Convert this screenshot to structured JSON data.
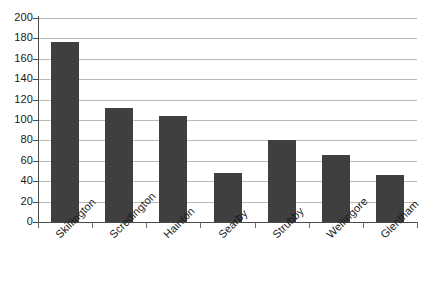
{
  "chart_data": {
    "type": "bar",
    "title": "",
    "subtitle": "",
    "xlabel": "",
    "ylabel": "",
    "categories": [
      "Skillington",
      "Scredington",
      "Hainton",
      "Searby",
      "Strubby",
      "Wellingore",
      "Glentham"
    ],
    "values": [
      176,
      112,
      104,
      48,
      80,
      66,
      46
    ],
    "ylim": [
      0,
      200
    ],
    "ytick_step": 20,
    "yticks": [
      "200",
      "180",
      "160",
      "140",
      "120",
      "100",
      "80",
      "60",
      "40",
      "20",
      "0"
    ],
    "grid": true,
    "legend": "none",
    "series_color": "#3f3f3f",
    "gridline_color": "#b9b9b9",
    "axis_color": "#4a4a4a",
    "background_color": "#ffffff"
  }
}
